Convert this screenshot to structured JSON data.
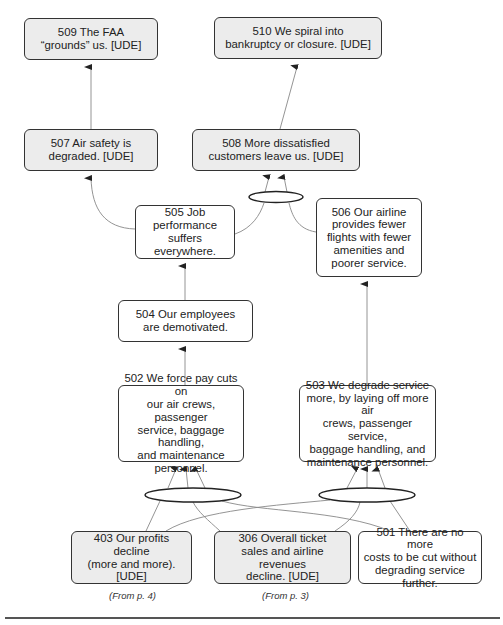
{
  "diagram": {
    "type": "current-reality-tree",
    "nodes": [
      {
        "id": "509",
        "text": "509  The FAA\n“grounds” us. [UDE]",
        "ude": true
      },
      {
        "id": "510",
        "text": "510  We spiral into\nbankruptcy or closure. [UDE]",
        "ude": true
      },
      {
        "id": "507",
        "text": "507  Air safety is\ndegraded. [UDE]",
        "ude": true
      },
      {
        "id": "508",
        "text": "508  More dissatisfied\ncustomers leave us. [UDE]",
        "ude": true
      },
      {
        "id": "505",
        "text": "505  Job\nperformance\nsuffers everywhere.",
        "ude": false
      },
      {
        "id": "506",
        "text": "506  Our airline\nprovides fewer\nflights with fewer\namenities and\npoorer service.",
        "ude": false
      },
      {
        "id": "504",
        "text": "504  Our employees\nare demotivated.",
        "ude": false
      },
      {
        "id": "502",
        "text": "502  We force pay cuts on\nour air crews, passenger\nservice, baggage handling,\nand maintenance\npersonnel.",
        "ude": false
      },
      {
        "id": "503",
        "text": "503  We degrade service\nmore, by laying off more air\ncrews, passenger service,\nbaggage handling, and\nmaintenance personnel.",
        "ude": false
      },
      {
        "id": "403",
        "text": "403  Our profits decline\n(more and more).\n[UDE]",
        "ude": true
      },
      {
        "id": "306",
        "text": "306  Overall ticket\nsales and airline revenues\ndecline. [UDE]",
        "ude": true
      },
      {
        "id": "501",
        "text": "501  There are no more\ncosts to be cut without\ndegrading service further.",
        "ude": false
      }
    ],
    "edges": [
      {
        "from": "507",
        "to": "509"
      },
      {
        "from": "508",
        "to": "510"
      },
      {
        "from": "505",
        "to": "507"
      },
      {
        "from": [
          "505",
          "506"
        ],
        "to": "508",
        "and": true
      },
      {
        "from": "504",
        "to": "505"
      },
      {
        "from": "502",
        "to": "504"
      },
      {
        "from": "503",
        "to": "506"
      },
      {
        "from": [
          "403",
          "306",
          "501"
        ],
        "to": "502",
        "and": true
      },
      {
        "from": [
          "403",
          "306",
          "501"
        ],
        "to": "503",
        "and": true
      }
    ],
    "annotations": {
      "from_403": "(From p. 4)",
      "from_306": "(From p. 3)"
    }
  }
}
